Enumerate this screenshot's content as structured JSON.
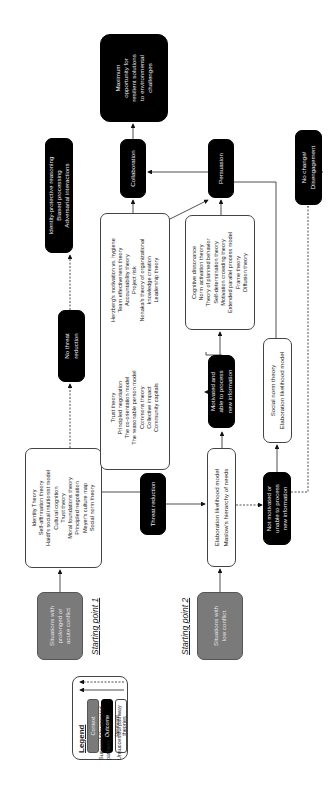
{
  "legend": {
    "title": "Legend",
    "context": "Context",
    "outcome": "Outcome",
    "theories": [
      "Relevant",
      "theories"
    ],
    "successful": "Successful/suggested pathway",
    "unsuccessful": "Unsuccessful pathway"
  },
  "starting_points": {
    "sp1": "Starting point 1",
    "sp2": "Starting point 2"
  },
  "contexts": {
    "prolonged": [
      "Situations with",
      "prolonged or",
      "acute conflict"
    ],
    "low": [
      "Situations with",
      "low conflict"
    ]
  },
  "theories": {
    "identity": [
      "Identity Theory",
      "Self-affirmation theory",
      "Haidt's social intuitionist model",
      "Cultural cognition",
      "Trust theory",
      "Moral foundations theory",
      "Principled negotiation",
      "Meyer's culture map",
      "Social norm theory"
    ],
    "elaboration": [
      "Elaboration likelihood model",
      "Maslow's hierarchy of needs"
    ],
    "trust_col1": [
      "Trust theory",
      "Principled negotiation",
      "The co-orientation model",
      "The reasonable person model",
      "Commons theory",
      "Collective impact",
      "Community capitals"
    ],
    "trust_col2": [
      "Herzberg's motivation vs. hygiene",
      "Team effectiveness theory",
      "Accountability theory",
      "Project risk",
      "Nonaka's theory of organizational",
      "knowledge creation",
      "Leadership theory"
    ],
    "cognitive": [
      "Cognitive dissonance",
      "Norm activation theory",
      "Theory of planned behavior",
      "Self-determination theory",
      "Motivation crowding theory",
      "Extended parallel process model",
      "Frame theory",
      "Diffusion theory"
    ],
    "social_norm": [
      "Social norm theory",
      "Elaboration likelihood model"
    ]
  },
  "outcomes": {
    "threat_reduction": [
      "Threat reduction"
    ],
    "no_threat_reduction": [
      "No threat",
      "reduction"
    ],
    "identity_protective": [
      "Identity-protective reasoning",
      "Biased processing",
      "Adversarial interactions"
    ],
    "motivated": [
      "Motivated and",
      "able to process",
      "new information"
    ],
    "not_motivated": [
      "Not motivated or",
      "unable to process",
      "new information"
    ],
    "collaboration": [
      "Collaboration"
    ],
    "persuasion": [
      "Persuasion"
    ],
    "maximum": [
      "Maximum",
      "opportunity for",
      "resilient solutions",
      "to environmental",
      "challenges"
    ],
    "no_change": [
      "No change/",
      "Disengagement"
    ]
  },
  "colors": {
    "context": "#7a7a7a",
    "outcome": "#000000",
    "theory_border": "#444444"
  }
}
